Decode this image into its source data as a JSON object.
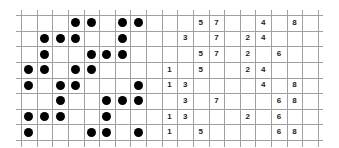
{
  "grid": {
    "rows": 8,
    "cols": 19,
    "origin_x": 21,
    "origin_y": 15,
    "cell_w": 15.63,
    "cell_h": 15.63,
    "line_color": "#a0a0a0",
    "dot_color": "#000000",
    "text_color": "#222222"
  },
  "dot_section": {
    "columns": 8,
    "rows": [
      [
        3,
        4,
        6,
        7
      ],
      [
        1,
        2,
        3,
        6
      ],
      [
        1,
        4,
        5,
        6
      ],
      [
        0,
        1,
        3,
        4
      ],
      [
        0,
        2,
        3,
        7
      ],
      [
        2,
        5,
        6,
        7
      ],
      [
        0,
        1,
        2,
        5
      ],
      [
        0,
        4,
        5,
        7
      ]
    ]
  },
  "number_section": {
    "column_values": {
      "9": "1",
      "10": "3",
      "11": "5",
      "12": "7",
      "14": "2",
      "15": "4",
      "16": "6",
      "17": "8"
    },
    "rows": [
      [
        "5",
        "7",
        "4",
        "8"
      ],
      [
        "3",
        "7",
        "2",
        "4"
      ],
      [
        "5",
        "7",
        "2",
        "6"
      ],
      [
        "1",
        "5",
        "2",
        "4"
      ],
      [
        "1",
        "3",
        "4",
        "8"
      ],
      [
        "3",
        "7",
        "6",
        "8"
      ],
      [
        "1",
        "3",
        "2",
        "6"
      ],
      [
        "1",
        "5",
        "6",
        "8"
      ]
    ]
  }
}
